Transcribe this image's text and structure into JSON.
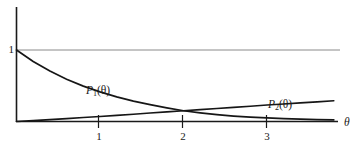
{
  "figure": {
    "title": "",
    "background_color": "#ffffff",
    "ink_color": "#1a1a1a",
    "gridline_color": "#888888"
  },
  "axes": {
    "x_axis_label": "θ",
    "y_value_label": "1",
    "x_tick_labels": [
      "1",
      "2",
      "3"
    ],
    "x_tick_values": [
      1,
      2,
      3
    ]
  },
  "curves": {
    "p1": {
      "label_P": "P",
      "label_sub": "1",
      "label_arg": "(θ)"
    },
    "p2": {
      "label_P": "P",
      "label_sub": "2",
      "label_arg": "(θ)"
    }
  },
  "chart_data": {
    "type": "line",
    "title": "",
    "xlabel": "θ",
    "ylabel": "",
    "xlim": [
      0,
      3.85
    ],
    "ylim": [
      0,
      1.12
    ],
    "grid": false,
    "gridlines_y": [
      1
    ],
    "xticks": [
      1,
      2,
      3
    ],
    "xticklabels": [
      "1",
      "2",
      "3"
    ],
    "yticks": [
      1
    ],
    "yticklabels": [
      "1"
    ],
    "legend": "inline-annotations",
    "annotations": [
      {
        "text": "P_1(θ)",
        "x": 1.1,
        "y": 0.4
      },
      {
        "text": "P_2(θ)",
        "x": 3.0,
        "y": 0.25
      },
      {
        "text": "θ",
        "x": 3.85,
        "y": 0.05
      }
    ],
    "series": [
      {
        "name": "P_1(θ)",
        "x": [
          0.0,
          0.2,
          0.4,
          0.6,
          0.8,
          1.0,
          1.2,
          1.4,
          1.6,
          1.8,
          2.0,
          2.2,
          2.4,
          2.6,
          2.8,
          3.0,
          3.2,
          3.4,
          3.6,
          3.8
        ],
        "y": [
          1.0,
          0.84,
          0.705,
          0.59,
          0.495,
          0.415,
          0.345,
          0.285,
          0.235,
          0.19,
          0.15,
          0.12,
          0.095,
          0.075,
          0.06,
          0.05,
          0.04,
          0.033,
          0.027,
          0.022
        ]
      },
      {
        "name": "P_2(θ)",
        "x": [
          0.0,
          0.2,
          0.4,
          0.6,
          0.8,
          1.0,
          1.2,
          1.4,
          1.6,
          1.8,
          2.0,
          2.2,
          2.4,
          2.6,
          2.8,
          3.0,
          3.2,
          3.4,
          3.6,
          3.8
        ],
        "y": [
          0.0,
          0.012,
          0.026,
          0.04,
          0.055,
          0.07,
          0.086,
          0.102,
          0.118,
          0.134,
          0.15,
          0.166,
          0.182,
          0.198,
          0.214,
          0.23,
          0.245,
          0.26,
          0.275,
          0.29
        ]
      }
    ]
  }
}
